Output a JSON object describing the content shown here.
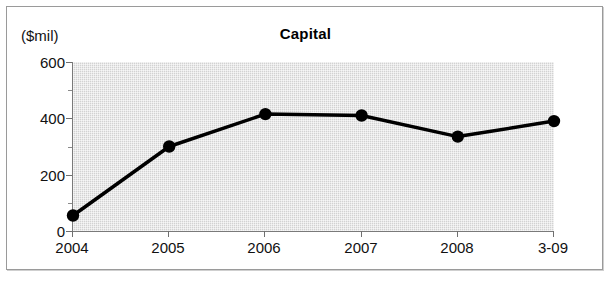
{
  "chart_data": {
    "type": "line",
    "title": "Capital",
    "xlabel": "",
    "ylabel": "($mil)",
    "categories": [
      "2004",
      "2005",
      "2006",
      "2007",
      "2008",
      "3-09"
    ],
    "values": [
      55,
      300,
      415,
      410,
      335,
      390
    ],
    "ylim": [
      0,
      600
    ],
    "y_major_ticks": [
      0,
      200,
      400,
      600
    ],
    "y_minor_ticks": [
      100,
      300,
      500
    ],
    "y_tick_labels": [
      "0",
      "200",
      "400",
      "600"
    ],
    "grid": false,
    "legend": "none",
    "series": [
      {
        "name": "Capital",
        "values": [
          55,
          300,
          415,
          410,
          335,
          390
        ],
        "line_color": "#000000",
        "marker": "circle",
        "marker_color": "#000000"
      }
    ],
    "plot_background_color": "#d2d2d2",
    "frame_color": "#9a9a9a"
  }
}
